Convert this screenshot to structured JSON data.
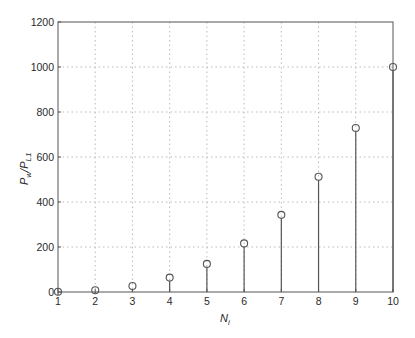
{
  "chart_data": {
    "type": "stem",
    "title": "",
    "xlabel": "N_i",
    "ylabel": "P_w/P_L1",
    "x": [
      1,
      2,
      3,
      4,
      5,
      6,
      7,
      8,
      9,
      10
    ],
    "values": [
      1,
      8,
      27,
      64,
      125,
      216,
      343,
      512,
      729,
      1000
    ],
    "xlim": [
      1,
      10
    ],
    "ylim": [
      0,
      1200
    ],
    "xticks": [
      1,
      2,
      3,
      4,
      5,
      6,
      7,
      8,
      9,
      10
    ],
    "yticks": [
      0,
      200,
      400,
      600,
      800,
      1000,
      1200
    ],
    "grid": true,
    "grid_style": "dotted",
    "marker": "open-circle",
    "legend": null,
    "colors": {
      "stem": "#555555",
      "axis": "#555555",
      "grid": "#bbbbbb",
      "text": "#2a2a2a"
    }
  },
  "labels": {
    "xlabel_main": "N",
    "xlabel_sub": "i",
    "ylabel_p1": "P",
    "ylabel_sub1": "w",
    "ylabel_mid": "/P",
    "ylabel_sub2": "L1"
  }
}
